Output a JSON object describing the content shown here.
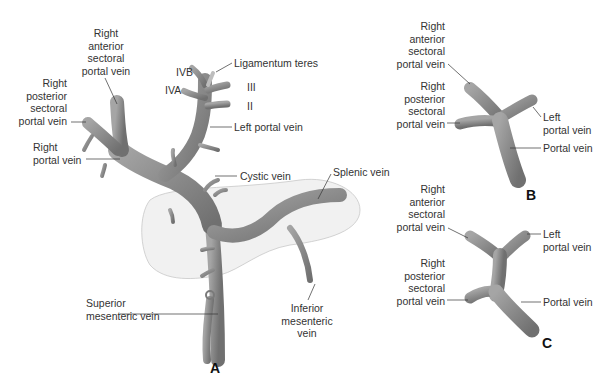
{
  "figure": {
    "panels": [
      {
        "id": "A",
        "label": "A",
        "labels": {
          "right_anterior_sectoral": [
            "Right",
            "anterior",
            "sectoral",
            "portal vein"
          ],
          "right_posterior_sectoral": [
            "Right",
            "posterior",
            "sectoral",
            "portal vein"
          ],
          "right_portal_vein": [
            "Right",
            "portal vein"
          ],
          "ivb": "IVB",
          "iva": "IVA",
          "ligamentum_teres": "Ligamentum teres",
          "segment_iii": "III",
          "segment_ii": "II",
          "left_portal_vein": "Left portal vein",
          "cystic_vein": "Cystic vein",
          "splenic_vein": "Splenic vein",
          "superior_mesenteric_vein": [
            "Superior",
            "mesenteric vein"
          ],
          "inferior_mesenteric_vein": [
            "Inferior",
            "mesenteric",
            "vein"
          ]
        }
      },
      {
        "id": "B",
        "label": "B",
        "labels": {
          "right_anterior_sectoral": [
            "Right",
            "anterior",
            "sectoral",
            "portal vein"
          ],
          "right_posterior_sectoral": [
            "Right",
            "posterior",
            "sectoral",
            "portal vein"
          ],
          "left_portal_vein": [
            "Left",
            "portal vein"
          ],
          "portal_vein": "Portal vein"
        }
      },
      {
        "id": "C",
        "label": "C",
        "labels": {
          "right_anterior_sectoral": [
            "Right",
            "anterior",
            "sectoral",
            "portal vein"
          ],
          "right_posterior_sectoral": [
            "Right",
            "posterior",
            "sectoral",
            "portal vein"
          ],
          "left_portal_vein": [
            "Left",
            "portal vein"
          ],
          "portal_vein": "Portal vein"
        }
      }
    ],
    "colors": {
      "vein": "#8a8a8a",
      "vein_dark": "#6e6e6e",
      "pancreas_fill": "#f1f1f1",
      "pancreas_outline": "#c8c8c8",
      "leader": "#333333"
    }
  }
}
